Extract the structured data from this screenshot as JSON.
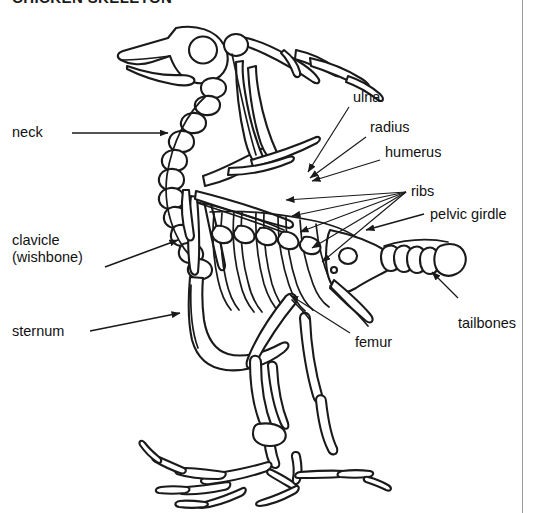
{
  "figure": {
    "title": "CHICKEN SKELETON",
    "border_color": "#9a9a9a",
    "line_color": "#1a1a1a",
    "background": "#ffffff"
  },
  "labels": {
    "neck": "neck",
    "clavicle_line1": "clavicle",
    "clavicle_line2": "(wishbone)",
    "sternum": "sternum",
    "ulna": "ulna",
    "radius": "radius",
    "humerus": "humerus",
    "ribs": "ribs",
    "pelvic_girdle": "pelvic girdle",
    "tailbones": "tailbones",
    "femur": "femur"
  },
  "callouts": [
    {
      "id": "neck",
      "label": "neck",
      "side": "left",
      "pointer": "arrow",
      "target": "cervical vertebrae"
    },
    {
      "id": "clavicle",
      "label": "clavicle (wishbone)",
      "side": "left",
      "pointer": "arrow",
      "target": "furcula"
    },
    {
      "id": "sternum",
      "label": "sternum",
      "side": "left",
      "pointer": "arrow",
      "target": "keel bone"
    },
    {
      "id": "ulna",
      "label": "ulna",
      "side": "right",
      "pointer": "arrow",
      "target": "wing forearm upper bone"
    },
    {
      "id": "radius",
      "label": "radius",
      "side": "right",
      "pointer": "arrow",
      "target": "wing forearm lower bone"
    },
    {
      "id": "humerus",
      "label": "humerus",
      "side": "right",
      "pointer": "arrow",
      "target": "wing upper arm bone"
    },
    {
      "id": "ribs",
      "label": "ribs",
      "side": "right",
      "pointer": "fan-lines",
      "target": "rib cage",
      "line_count": 5
    },
    {
      "id": "pelvic-girdle",
      "label": "pelvic girdle",
      "side": "right",
      "pointer": "arrow",
      "target": "pelvis"
    },
    {
      "id": "tailbones",
      "label": "tailbones",
      "side": "right",
      "pointer": "arrow",
      "target": "caudal vertebrae"
    },
    {
      "id": "femur",
      "label": "femur",
      "side": "right",
      "pointer": "arrow",
      "target": "thigh bone"
    }
  ]
}
